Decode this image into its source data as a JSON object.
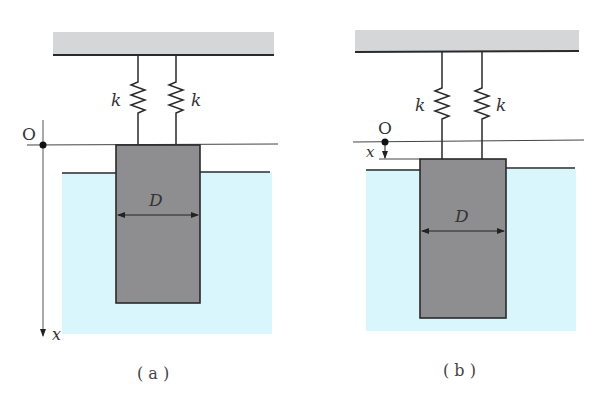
{
  "figure_a": {
    "caption": "( a )",
    "spring_left_label": "k",
    "spring_right_label": "k",
    "origin_label": "O",
    "width_label": "D",
    "axis_label": "x"
  },
  "figure_b": {
    "caption": "( b )",
    "spring_left_label": "k",
    "spring_right_label": "k",
    "origin_label": "O",
    "width_label": "D",
    "displacement_label": "x"
  },
  "colors": {
    "ceiling": "#d4d6d8",
    "water": "#d8f6fb",
    "block": "#8e8e90",
    "line": "#2a2a2a"
  }
}
